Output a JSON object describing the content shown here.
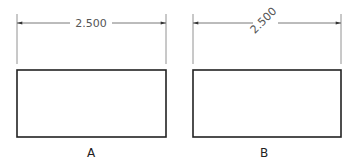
{
  "figures": [
    {
      "id": "A",
      "label": "A",
      "dimension_text": "2.500",
      "dimension_text_orientation": "horizontal (aligned)",
      "rect": {
        "x": 17,
        "y": 70,
        "w": 149,
        "h": 67
      },
      "dim_line_y": 23,
      "ext_top": 14,
      "ext_bottom": 64
    },
    {
      "id": "B",
      "label": "B",
      "dimension_text": "2.500",
      "dimension_text_orientation": "angled (approx. -45°)",
      "rect": {
        "x": 193,
        "y": 70,
        "w": 148,
        "h": 67
      },
      "dim_line_y": 23,
      "ext_top": 14,
      "ext_bottom": 64
    }
  ],
  "colors": {
    "outline": "#222222",
    "dimension": "#555555",
    "background": "#ffffff"
  }
}
